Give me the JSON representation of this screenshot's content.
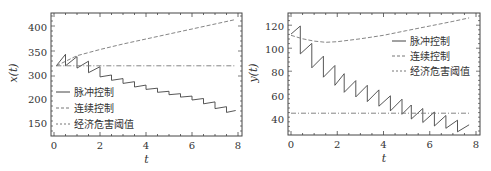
{
  "chart_data": [
    {
      "type": "line",
      "title": "",
      "xlabel": "t",
      "ylabel": "x(t)",
      "xlim": [
        0,
        8
      ],
      "x_ticks": [
        "0",
        "2",
        "4",
        "6",
        "8"
      ],
      "y_ticks": [
        "400",
        "350",
        "300",
        "200",
        "150"
      ],
      "legend": [
        "脉冲控制",
        "连续控制",
        "经济危害阈值"
      ],
      "legend_position": "lower-left",
      "grid": false,
      "series": [
        {
          "name": "脉冲控制",
          "style": "solid",
          "note": "sawtooth: rises between pulses, drops at each pulse (period 0.5)",
          "x": [
            0.1,
            0.5,
            0.5,
            1.0,
            1.0,
            1.5,
            1.5,
            2.0,
            2.0,
            2.5,
            2.5,
            3.0,
            3.0,
            3.5,
            3.5,
            4.0,
            4.0,
            4.5,
            4.5,
            5.0,
            5.0,
            5.5,
            5.5,
            6.0,
            6.0,
            6.5,
            6.5,
            7.0,
            7.0,
            7.5,
            7.5,
            7.9
          ],
          "y": [
            320,
            345,
            320,
            340,
            315,
            330,
            305,
            318,
            292,
            300,
            278,
            285,
            265,
            272,
            250,
            258,
            240,
            245,
            228,
            232,
            218,
            222,
            208,
            212,
            198,
            202,
            190,
            194,
            180,
            184,
            172,
            176
          ]
        },
        {
          "name": "连续控制",
          "style": "dashed",
          "x": [
            0.1,
            1,
            2,
            3,
            4,
            5,
            6,
            7,
            7.9
          ],
          "y": [
            320,
            342,
            355,
            366,
            376,
            386,
            396,
            406,
            415
          ]
        },
        {
          "name": "经济危害阈值",
          "style": "dash-dot",
          "x": [
            0.1,
            7.9
          ],
          "y": [
            320,
            320
          ]
        }
      ]
    },
    {
      "type": "line",
      "title": "",
      "xlabel": "t",
      "ylabel": "y(t)",
      "xlim": [
        0,
        8
      ],
      "ylim": [
        25,
        130
      ],
      "x_ticks": [
        "0",
        "2",
        "4",
        "6",
        "8"
      ],
      "y_ticks": [
        "120",
        "100",
        "80",
        "60",
        "40"
      ],
      "legend": [
        "脉冲控制",
        "连续控制",
        "经济危害阈值"
      ],
      "legend_position": "upper-right",
      "grid": false,
      "series": [
        {
          "name": "脉冲控制",
          "style": "solid",
          "x": [
            0,
            0.4,
            0.4,
            0.9,
            0.9,
            1.4,
            1.4,
            1.9,
            1.9,
            2.3,
            2.3,
            2.8,
            2.8,
            3.3,
            3.3,
            3.8,
            3.8,
            4.3,
            4.3,
            4.8,
            4.8,
            5.2,
            5.2,
            5.7,
            5.7,
            6.2,
            6.2,
            6.7,
            6.7,
            7.2,
            7.2,
            7.7
          ],
          "y": [
            113,
            120,
            96,
            105,
            84,
            94,
            76,
            86,
            69,
            79,
            63,
            73,
            59,
            69,
            55,
            65,
            51,
            60,
            47,
            57,
            44,
            52,
            40,
            49,
            37,
            46,
            34,
            43,
            32,
            39,
            29,
            35
          ]
        },
        {
          "name": "连续控制",
          "style": "dashed",
          "x": [
            0,
            0.5,
            1,
            1.5,
            2,
            3,
            4,
            5,
            6,
            7,
            7.7
          ],
          "y": [
            112,
            109,
            107,
            106,
            106.5,
            109,
            112,
            116,
            120,
            124,
            127
          ]
        },
        {
          "name": "经济危害阈值",
          "style": "dash-dot",
          "x": [
            0,
            7.7
          ],
          "y": [
            45,
            45
          ]
        }
      ]
    }
  ]
}
